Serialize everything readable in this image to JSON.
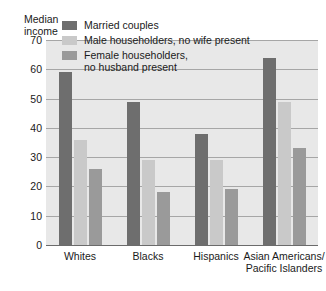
{
  "chart_data": {
    "type": "bar",
    "title": "",
    "xlabel": "",
    "ylabel": "Median\nincome",
    "ylim": [
      0,
      70
    ],
    "yticks": [
      0,
      10,
      20,
      30,
      40,
      50,
      60,
      70
    ],
    "grid": true,
    "legend_position": "top-left",
    "categories": [
      "Whites",
      "Blacks",
      "Hispanics",
      "Asian Americans/\nPacific Islanders"
    ],
    "series": [
      {
        "name": "Married couples",
        "color": "#6e6e6e",
        "values": [
          59,
          49,
          38,
          64
        ]
      },
      {
        "name": "Male householders, no wife present",
        "color": "#c9c9c9",
        "values": [
          36,
          29,
          29,
          49
        ]
      },
      {
        "name": "Female householders,\nno husband present",
        "color": "#9a9a9a",
        "values": [
          26,
          18,
          19,
          33
        ]
      }
    ]
  },
  "colors": {
    "plot_background": "#e8e8e8",
    "gridline": "#a6a6a6",
    "axis": "#6b6b6b",
    "text": "#1a1a1a"
  }
}
